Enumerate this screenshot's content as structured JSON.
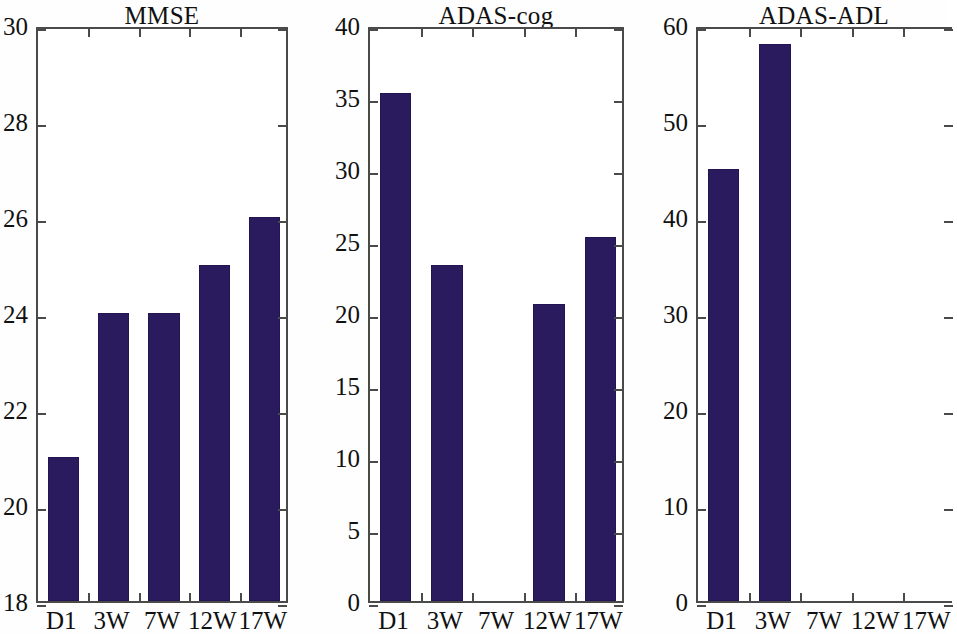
{
  "figure": {
    "background_color": "#ffffff",
    "bar_color": "#2a1a5e",
    "axis_color": "#4a4a4a",
    "text_color": "#111111"
  },
  "chart_data": [
    {
      "type": "bar",
      "title": "MMSE",
      "xlabel": "",
      "ylabel": "",
      "categories": [
        "D1",
        "3W",
        "7W",
        "12W",
        "17W"
      ],
      "values": [
        21.0,
        24.0,
        24.0,
        25.0,
        26.0
      ],
      "ylim": [
        18,
        30
      ],
      "yticks": [
        18,
        20,
        22,
        24,
        26,
        28,
        30
      ],
      "ytick_labels": [
        "18",
        "20",
        "22",
        "24",
        "26",
        "28",
        "30"
      ],
      "grid": false,
      "legend": "none"
    },
    {
      "type": "bar",
      "title": "ADAS-cog",
      "xlabel": "",
      "ylabel": "",
      "categories": [
        "D1",
        "3W",
        "7W",
        "12W",
        "17W"
      ],
      "values": [
        35.3,
        23.3,
        0,
        20.6,
        25.3
      ],
      "ylim": [
        0,
        40
      ],
      "yticks": [
        0,
        5,
        10,
        15,
        20,
        25,
        30,
        35,
        40
      ],
      "ytick_labels": [
        "0",
        "5",
        "10",
        "15",
        "20",
        "25",
        "30",
        "35",
        "40"
      ],
      "grid": false,
      "legend": "none"
    },
    {
      "type": "bar",
      "title": "ADAS-ADL",
      "xlabel": "",
      "ylabel": "",
      "categories": [
        "D1",
        "3W",
        "7W",
        "12W",
        "17W"
      ],
      "values": [
        45.0,
        58.0,
        0,
        0,
        0
      ],
      "ylim": [
        0,
        60
      ],
      "yticks": [
        0,
        10,
        20,
        30,
        40,
        50,
        60
      ],
      "ytick_labels": [
        "0",
        "10",
        "20",
        "30",
        "40",
        "50",
        "60"
      ],
      "grid": false,
      "legend": "none"
    }
  ],
  "panels": [
    {
      "left": 36,
      "right": 288,
      "top": 27,
      "bottom": 603,
      "clipped_right": false,
      "title_center": 162
    },
    {
      "left": 368,
      "right": 624,
      "top": 27,
      "bottom": 603,
      "clipped_right": false,
      "title_center": 496
    },
    {
      "left": 696,
      "right": 952,
      "top": 27,
      "bottom": 603,
      "clipped_right": true,
      "title_center": 824
    }
  ]
}
